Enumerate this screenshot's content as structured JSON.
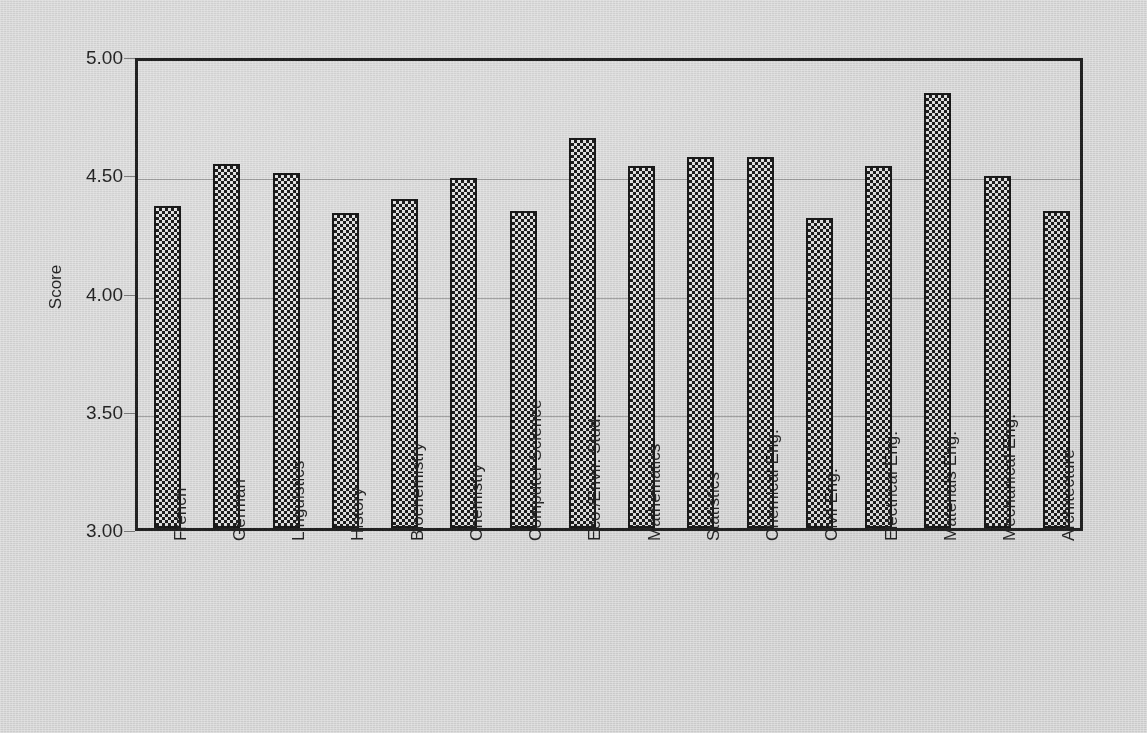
{
  "chart_data": {
    "type": "bar",
    "title": "",
    "xlabel": "",
    "ylabel": "Score",
    "ylim": [
      3.0,
      5.0
    ],
    "ytick_labels": [
      "5.00",
      "4.50",
      "4.00",
      "3.50",
      "3.00"
    ],
    "ytick_values": [
      5.0,
      4.5,
      4.0,
      3.5,
      3.0
    ],
    "grid": true,
    "legend": "none",
    "categories": [
      "French",
      "German",
      "Linguistics",
      "History",
      "Biochemistry",
      "Chemistry",
      "Computer Science",
      "Eco./Envir. Stud.",
      "Mathematics",
      "Statistics",
      "Chemical Eng.",
      "Civil Eng.",
      "Electrical Eng.",
      "Materials  Eng.",
      "Mechanical Eng.",
      "Architecture"
    ],
    "values": [
      4.36,
      4.54,
      4.5,
      4.33,
      4.39,
      4.48,
      4.34,
      4.65,
      4.53,
      4.57,
      4.57,
      4.31,
      4.53,
      4.84,
      4.49,
      4.34
    ],
    "bar_fill": "checkerboard",
    "bar_edge_color": "#101010",
    "background_color": "#e9e9e9"
  },
  "axes": {
    "y_title": "Score"
  }
}
